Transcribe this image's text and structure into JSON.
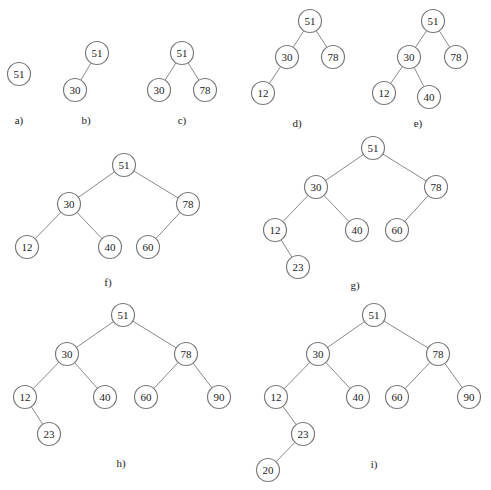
{
  "node_radius": 11.5,
  "colors": {
    "edge": "#8a8a8a",
    "node_stroke": "#7a7a7a",
    "node_fill": "#ffffff",
    "text": "#222222"
  },
  "trees": [
    {
      "id": "a",
      "label": "a)",
      "label_pos": [
        19,
        120
      ],
      "nodes": [
        {
          "id": "a51",
          "value": "51",
          "x": 19,
          "y": 74
        }
      ],
      "edges": []
    },
    {
      "id": "b",
      "label": "b)",
      "label_pos": [
        86,
        120
      ],
      "nodes": [
        {
          "id": "b51",
          "value": "51",
          "x": 97,
          "y": 53
        },
        {
          "id": "b30",
          "value": "30",
          "x": 75,
          "y": 90
        }
      ],
      "edges": [
        [
          "b51",
          "b30"
        ]
      ]
    },
    {
      "id": "c",
      "label": "c)",
      "label_pos": [
        182,
        120
      ],
      "nodes": [
        {
          "id": "c51",
          "value": "51",
          "x": 182,
          "y": 53
        },
        {
          "id": "c30",
          "value": "30",
          "x": 159,
          "y": 90
        },
        {
          "id": "c78",
          "value": "78",
          "x": 205,
          "y": 90
        }
      ],
      "edges": [
        [
          "c51",
          "c30"
        ],
        [
          "c51",
          "c78"
        ]
      ]
    },
    {
      "id": "d",
      "label": "d)",
      "label_pos": [
        297,
        123
      ],
      "nodes": [
        {
          "id": "d51",
          "value": "51",
          "x": 310,
          "y": 21
        },
        {
          "id": "d30",
          "value": "30",
          "x": 287,
          "y": 57
        },
        {
          "id": "d78",
          "value": "78",
          "x": 333,
          "y": 57
        },
        {
          "id": "d12",
          "value": "12",
          "x": 263,
          "y": 93
        }
      ],
      "edges": [
        [
          "d51",
          "d30"
        ],
        [
          "d51",
          "d78"
        ],
        [
          "d30",
          "d12"
        ]
      ]
    },
    {
      "id": "e",
      "label": "e)",
      "label_pos": [
        418,
        123
      ],
      "nodes": [
        {
          "id": "e51",
          "value": "51",
          "x": 433,
          "y": 21
        },
        {
          "id": "e30",
          "value": "30",
          "x": 409,
          "y": 57
        },
        {
          "id": "e78",
          "value": "78",
          "x": 456,
          "y": 57
        },
        {
          "id": "e12",
          "value": "12",
          "x": 384,
          "y": 93
        },
        {
          "id": "e40",
          "value": "40",
          "x": 429,
          "y": 97
        }
      ],
      "edges": [
        [
          "e51",
          "e30"
        ],
        [
          "e51",
          "e78"
        ],
        [
          "e30",
          "e12"
        ],
        [
          "e30",
          "e40"
        ]
      ]
    },
    {
      "id": "f",
      "label": "f)",
      "label_pos": [
        108,
        282
      ],
      "nodes": [
        {
          "id": "f51",
          "value": "51",
          "x": 124,
          "y": 165
        },
        {
          "id": "f30",
          "value": "30",
          "x": 69,
          "y": 204
        },
        {
          "id": "f78",
          "value": "78",
          "x": 188,
          "y": 204
        },
        {
          "id": "f12",
          "value": "12",
          "x": 27,
          "y": 247
        },
        {
          "id": "f40",
          "value": "40",
          "x": 110,
          "y": 247
        },
        {
          "id": "f60",
          "value": "60",
          "x": 148,
          "y": 247
        }
      ],
      "edges": [
        [
          "f51",
          "f30"
        ],
        [
          "f51",
          "f78"
        ],
        [
          "f30",
          "f12"
        ],
        [
          "f30",
          "f40"
        ],
        [
          "f78",
          "f60"
        ]
      ]
    },
    {
      "id": "g",
      "label": "g)",
      "label_pos": [
        355,
        285
      ],
      "nodes": [
        {
          "id": "g51",
          "value": "51",
          "x": 373,
          "y": 148
        },
        {
          "id": "g30",
          "value": "30",
          "x": 316,
          "y": 187
        },
        {
          "id": "g78",
          "value": "78",
          "x": 436,
          "y": 187
        },
        {
          "id": "g12",
          "value": "12",
          "x": 275,
          "y": 230
        },
        {
          "id": "g40",
          "value": "40",
          "x": 357,
          "y": 230
        },
        {
          "id": "g60",
          "value": "60",
          "x": 397,
          "y": 230
        },
        {
          "id": "g23",
          "value": "23",
          "x": 298,
          "y": 267
        }
      ],
      "edges": [
        [
          "g51",
          "g30"
        ],
        [
          "g51",
          "g78"
        ],
        [
          "g30",
          "g12"
        ],
        [
          "g30",
          "g40"
        ],
        [
          "g78",
          "g60"
        ],
        [
          "g12",
          "g23"
        ]
      ]
    },
    {
      "id": "h",
      "label": "h)",
      "label_pos": [
        121,
        463
      ],
      "nodes": [
        {
          "id": "h51",
          "value": "51",
          "x": 123,
          "y": 315
        },
        {
          "id": "h30",
          "value": "30",
          "x": 67,
          "y": 354
        },
        {
          "id": "h78",
          "value": "78",
          "x": 186,
          "y": 354
        },
        {
          "id": "h12",
          "value": "12",
          "x": 25,
          "y": 397
        },
        {
          "id": "h40",
          "value": "40",
          "x": 105,
          "y": 397
        },
        {
          "id": "h60",
          "value": "60",
          "x": 146,
          "y": 397
        },
        {
          "id": "h90",
          "value": "90",
          "x": 219,
          "y": 397
        },
        {
          "id": "h23",
          "value": "23",
          "x": 49,
          "y": 434
        }
      ],
      "edges": [
        [
          "h51",
          "h30"
        ],
        [
          "h51",
          "h78"
        ],
        [
          "h30",
          "h12"
        ],
        [
          "h30",
          "h40"
        ],
        [
          "h78",
          "h60"
        ],
        [
          "h78",
          "h90"
        ],
        [
          "h12",
          "h23"
        ]
      ]
    },
    {
      "id": "i",
      "label": "i)",
      "label_pos": [
        374,
        464
      ],
      "nodes": [
        {
          "id": "i51",
          "value": "51",
          "x": 374,
          "y": 315
        },
        {
          "id": "i30",
          "value": "30",
          "x": 318,
          "y": 354
        },
        {
          "id": "i78",
          "value": "78",
          "x": 438,
          "y": 354
        },
        {
          "id": "i12",
          "value": "12",
          "x": 276,
          "y": 397
        },
        {
          "id": "i40",
          "value": "40",
          "x": 358,
          "y": 397
        },
        {
          "id": "i60",
          "value": "60",
          "x": 397,
          "y": 397
        },
        {
          "id": "i90",
          "value": "90",
          "x": 469,
          "y": 397
        },
        {
          "id": "i23",
          "value": "23",
          "x": 303,
          "y": 434
        },
        {
          "id": "i20",
          "value": "20",
          "x": 268,
          "y": 470
        }
      ],
      "edges": [
        [
          "i51",
          "i30"
        ],
        [
          "i51",
          "i78"
        ],
        [
          "i30",
          "i12"
        ],
        [
          "i30",
          "i40"
        ],
        [
          "i78",
          "i60"
        ],
        [
          "i78",
          "i90"
        ],
        [
          "i12",
          "i23"
        ],
        [
          "i23",
          "i20"
        ]
      ]
    }
  ]
}
